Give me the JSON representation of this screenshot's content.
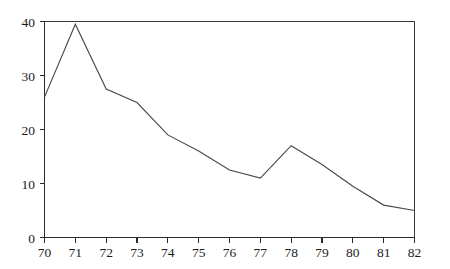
{
  "chart_data": {
    "type": "line",
    "title": "",
    "subtitle": "",
    "xlabel": "",
    "ylabel": "",
    "x": [
      70,
      71,
      72,
      73,
      74,
      75,
      76,
      77,
      78,
      79,
      80,
      81,
      82
    ],
    "values": [
      26,
      39.5,
      27.5,
      25,
      19,
      16,
      12.5,
      11,
      17,
      13.5,
      9.5,
      6,
      5
    ],
    "series": [
      {
        "name": "series-1",
        "values": [
          26,
          39.5,
          27.5,
          25,
          19,
          16,
          12.5,
          11,
          17,
          13.5,
          9.5,
          6,
          5
        ]
      }
    ],
    "xlim": [
      70,
      82
    ],
    "ylim": [
      0,
      40
    ],
    "x_ticks": [
      70,
      71,
      72,
      73,
      74,
      75,
      76,
      77,
      78,
      79,
      80,
      81,
      82
    ],
    "x_tick_labels": [
      "70",
      "71",
      "72",
      "73",
      "74",
      "75",
      "76",
      "77",
      "78",
      "79",
      "80",
      "81",
      "82"
    ],
    "y_ticks": [
      0,
      10,
      20,
      30,
      40
    ],
    "y_tick_labels": [
      "0",
      "10",
      "20",
      "30",
      "40"
    ],
    "grid": false,
    "legend": false,
    "legend_position": "none",
    "line_color": "#4a4a4a",
    "axis_color": "#2b2b2b",
    "background_color": "#ffffff",
    "annotations": []
  }
}
